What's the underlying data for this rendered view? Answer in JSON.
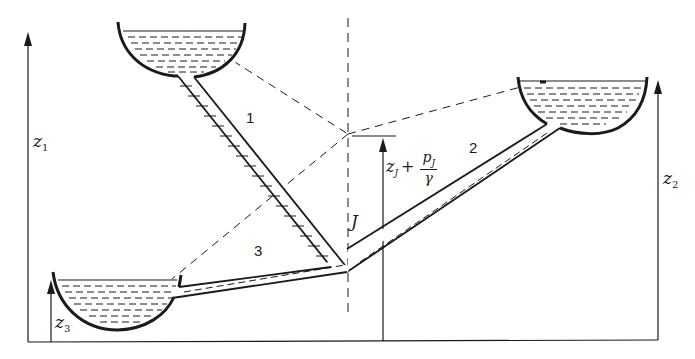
{
  "diagram": {
    "type": "three-reservoir pipe network",
    "reservoirs": [
      {
        "id": 1,
        "elevation_label": "z",
        "elevation_subscript": "1"
      },
      {
        "id": 2,
        "elevation_label": "z",
        "elevation_subscript": "2"
      },
      {
        "id": 3,
        "elevation_label": "z",
        "elevation_subscript": "3"
      }
    ],
    "pipes": [
      {
        "label": "1"
      },
      {
        "label": "2"
      },
      {
        "label": "3"
      }
    ],
    "junction": {
      "label": "J",
      "head_label": {
        "z": "z",
        "z_sub": "J",
        "plus": "+",
        "numerator": "p",
        "numerator_sub": "J",
        "denominator": "γ"
      }
    },
    "colors": {
      "line": "#1a1a1a",
      "background": "#ffffff"
    }
  }
}
